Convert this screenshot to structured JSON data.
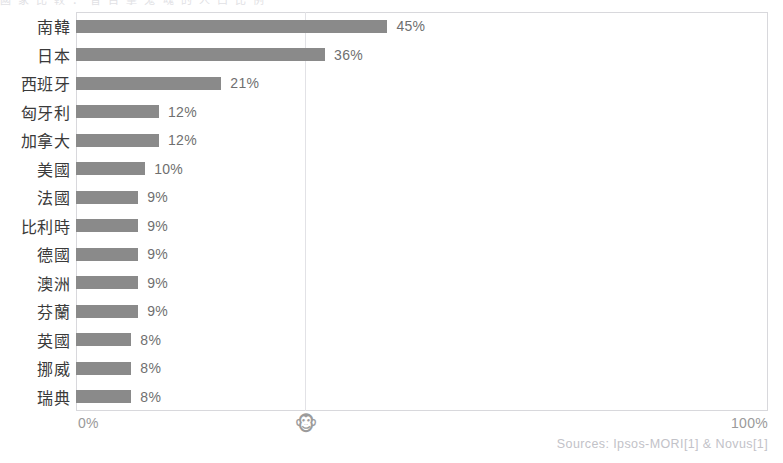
{
  "clipped_header_text": "國 家 比 較 ： 曾 目 擊 鬼 魂 的 人 口 比 例",
  "axis": {
    "min_label": "0%",
    "max_label": "100%",
    "midpoint_marker_icon": "monkey-face-icon",
    "midpoint_marker_glyph": "🐵"
  },
  "source_note": "Sources: Ipsos-MORI[1] & Novus[1]",
  "colors": {
    "bar": "#8a8a8a",
    "frame": "#d8d8dc",
    "gridline": "#e2e2e6",
    "label_text": "#3a3a3a",
    "value_text": "#6f6f6f",
    "axis_text": "#9a9a9a",
    "source_text": "#c2c2c8"
  },
  "chart_data": {
    "type": "bar",
    "orientation": "horizontal",
    "title": "",
    "xlabel": "",
    "ylabel": "",
    "xlim": [
      0,
      100
    ],
    "grid": true,
    "gridlines_at": [
      50
    ],
    "legend": "none",
    "categories": [
      "南韓",
      "日本",
      "西班牙",
      "匈牙利",
      "加拿大",
      "美國",
      "法國",
      "比利時",
      "德國",
      "澳洲",
      "芬蘭",
      "英國",
      "挪威",
      "瑞典"
    ],
    "values": [
      45,
      36,
      21,
      12,
      12,
      10,
      9,
      9,
      9,
      9,
      9,
      8,
      8,
      8
    ],
    "value_labels": [
      "45%",
      "36%",
      "21%",
      "12%",
      "12%",
      "10%",
      "9%",
      "9%",
      "9%",
      "9%",
      "9%",
      "8%",
      "8%",
      "8%"
    ],
    "rows": [
      {
        "category": "南韓",
        "value": 45,
        "label": "45%"
      },
      {
        "category": "日本",
        "value": 36,
        "label": "36%"
      },
      {
        "category": "西班牙",
        "value": 21,
        "label": "21%"
      },
      {
        "category": "匈牙利",
        "value": 12,
        "label": "12%"
      },
      {
        "category": "加拿大",
        "value": 12,
        "label": "12%"
      },
      {
        "category": "美國",
        "value": 10,
        "label": "10%"
      },
      {
        "category": "法國",
        "value": 9,
        "label": "9%"
      },
      {
        "category": "比利時",
        "value": 9,
        "label": "9%"
      },
      {
        "category": "德國",
        "value": 9,
        "label": "9%"
      },
      {
        "category": "澳洲",
        "value": 9,
        "label": "9%"
      },
      {
        "category": "芬蘭",
        "value": 9,
        "label": "9%"
      },
      {
        "category": "英國",
        "value": 8,
        "label": "8%"
      },
      {
        "category": "挪威",
        "value": 8,
        "label": "8%"
      },
      {
        "category": "瑞典",
        "value": 8,
        "label": "8%"
      }
    ]
  }
}
